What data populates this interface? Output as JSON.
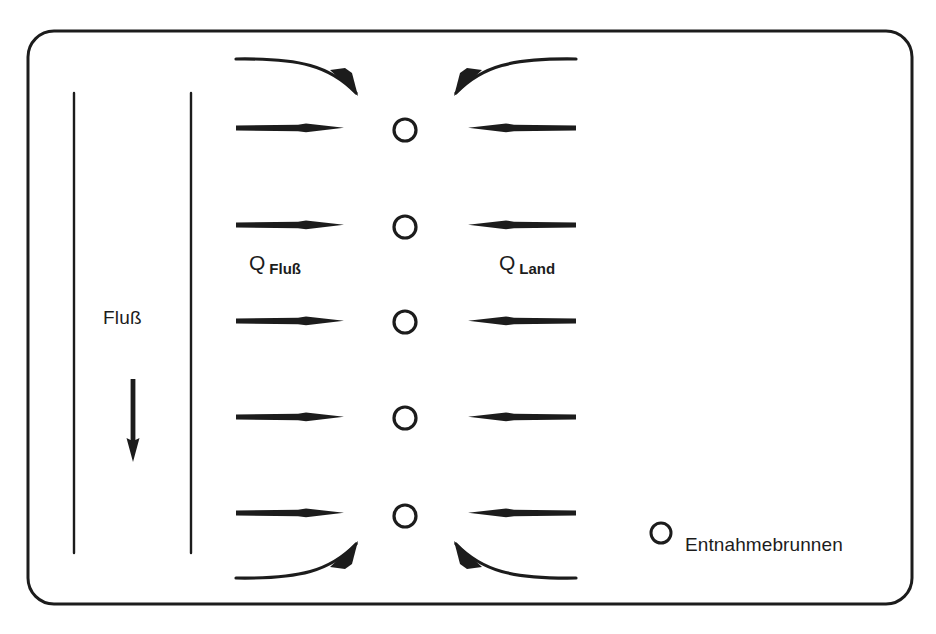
{
  "figure": {
    "title_cropped_sliver": "",
    "background_color": "#ffffff",
    "ink_color": "#1c1c1c",
    "frame": {
      "name": "aquifer-domain-boundary",
      "shape": "rounded-rectangle",
      "x": 28,
      "y": 31,
      "width": 884,
      "height": 573,
      "corner_radius": 26,
      "stroke_width": 3
    }
  },
  "labels": {
    "river": "Fluß",
    "q_river_main": "Q",
    "q_river_sub": "Fluß",
    "q_land_main": "Q",
    "q_land_sub": "Land",
    "legend_well": "Entnahmebrunnen"
  },
  "river": {
    "name": "river-channel",
    "left_bank_x": 74,
    "right_bank_x": 191,
    "top_y": 93,
    "bottom_y": 553,
    "flow_direction": "downstream",
    "flow_arrow": {
      "x": 133,
      "y_start": 379,
      "y_end": 462
    }
  },
  "wells": {
    "name": "extraction-well-column",
    "count": 5,
    "x": 405,
    "radius": 11,
    "rows_y": [
      130,
      227,
      322,
      418,
      516
    ]
  },
  "flow_arrows": {
    "river_side": {
      "label_ref": "Q_Fluß",
      "direction": "right",
      "x_start": 236,
      "x_end": 344,
      "rows_y": [
        128,
        225,
        321,
        417,
        513
      ]
    },
    "land_side": {
      "label_ref": "Q_Land",
      "direction": "left",
      "x_start": 576,
      "x_end": 466,
      "rows_y": [
        128,
        225,
        321,
        417,
        513
      ]
    }
  },
  "curved_arrows": [
    {
      "name": "top-left-curved-inflow",
      "direction": "down-right"
    },
    {
      "name": "top-right-curved-inflow",
      "direction": "down-left"
    },
    {
      "name": "bottom-left-curved-inflow",
      "direction": "up-right"
    },
    {
      "name": "bottom-right-curved-inflow",
      "direction": "up-left"
    }
  ],
  "legend": {
    "symbol": "open-circle",
    "symbol_x": 661,
    "symbol_y": 533,
    "symbol_radius": 10,
    "text": "Entnahmebrunnen"
  }
}
